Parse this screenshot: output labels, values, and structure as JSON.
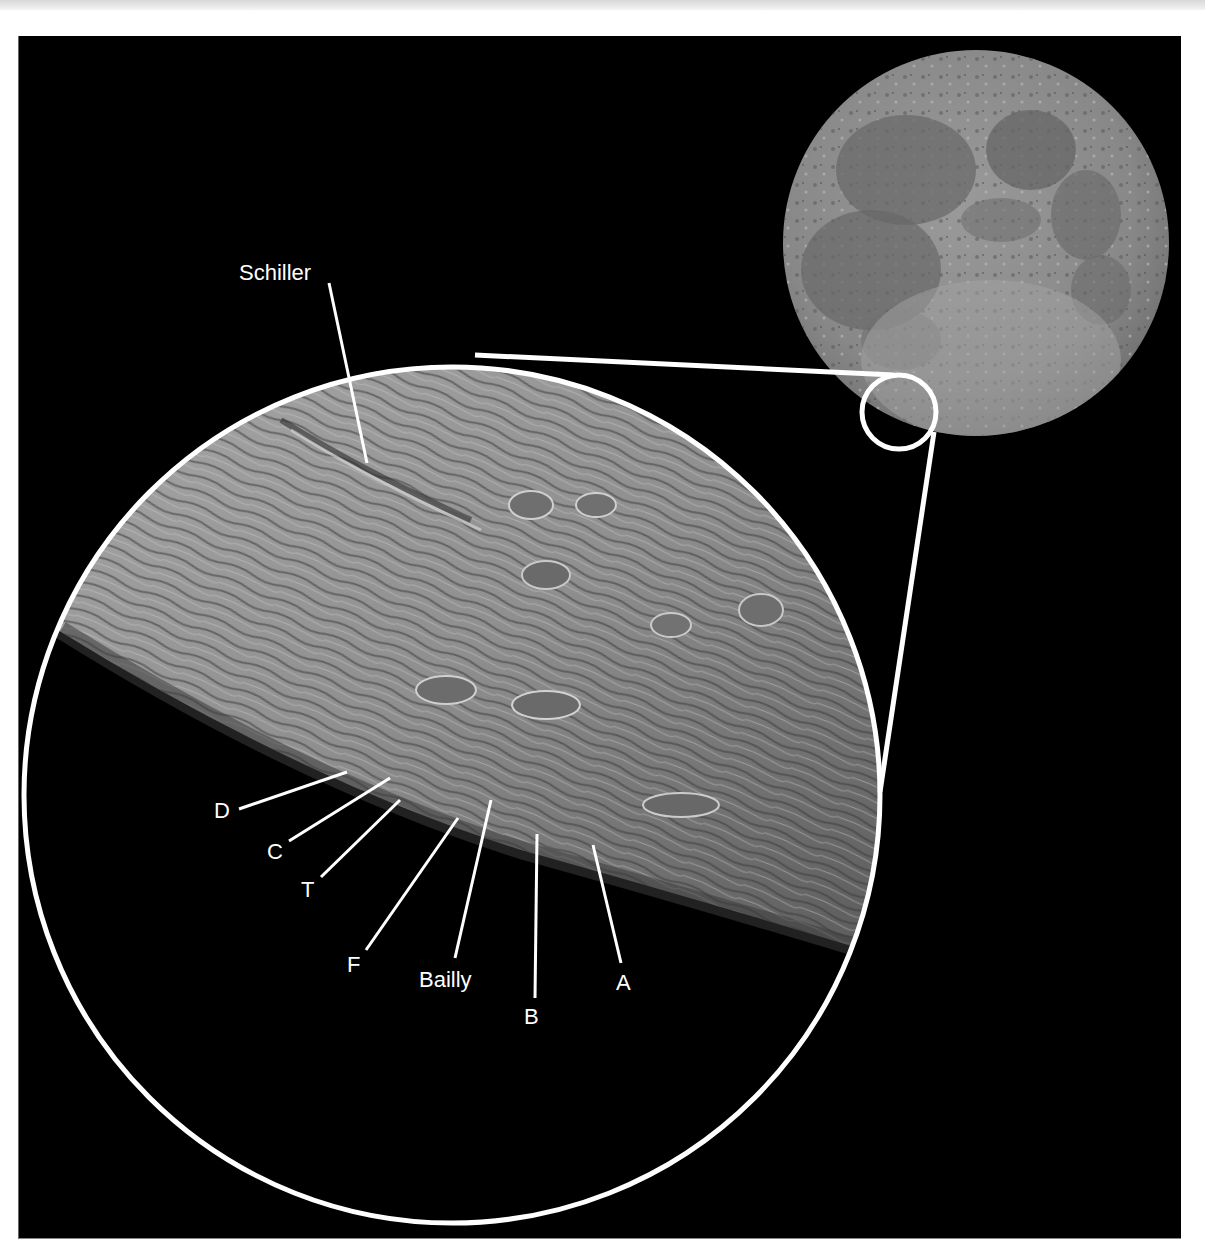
{
  "figure": {
    "background_color": "#000000",
    "line_color": "#ffffff",
    "full_moon": {
      "description": "Full Moon disc, near side",
      "highlight_region": "southwest limb (Schiller / Bailly area)"
    },
    "inset": {
      "description": "Magnified view of the southwestern lunar limb"
    },
    "labels": {
      "schiller": "Schiller",
      "d": "D",
      "c": "C",
      "t": "T",
      "f": "F",
      "bailly": "Bailly",
      "b": "B",
      "a": "A"
    }
  }
}
